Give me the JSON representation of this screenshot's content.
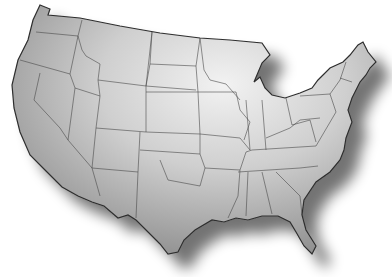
{
  "map": {
    "title": "United States map",
    "style": "grayscale embossed",
    "colors": {
      "background": "#ffffff",
      "land_light": "#e6e6e6",
      "land_dark": "#8c8c8c",
      "border": "#3c3c3c",
      "shadow": "#000000"
    }
  }
}
